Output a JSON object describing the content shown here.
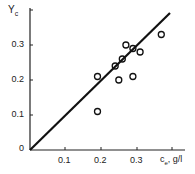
{
  "chart_data": {
    "type": "scatter",
    "title": "",
    "xlabel": "cₑ, g/l",
    "ylabel": "Yᴄ",
    "xlim": [
      0,
      0.45
    ],
    "ylim": [
      0,
      0.4
    ],
    "grid": false,
    "legend": null,
    "x_ticks": [
      0.1,
      0.2,
      0.3,
      0.4
    ],
    "x_tick_labels": [
      "0.1",
      "0.2",
      "0.3",
      ""
    ],
    "y_ticks": [
      0,
      0.1,
      0.2,
      0.3
    ],
    "y_tick_labels": [
      "0",
      "0.1",
      "0.2",
      "0.3"
    ],
    "series": [
      {
        "name": "measured",
        "marker": "open-circle",
        "points": [
          {
            "x": 0.19,
            "y": 0.21
          },
          {
            "x": 0.19,
            "y": 0.11
          },
          {
            "x": 0.24,
            "y": 0.24
          },
          {
            "x": 0.25,
            "y": 0.2
          },
          {
            "x": 0.26,
            "y": 0.26
          },
          {
            "x": 0.27,
            "y": 0.3
          },
          {
            "x": 0.29,
            "y": 0.29
          },
          {
            "x": 0.29,
            "y": 0.21
          },
          {
            "x": 0.31,
            "y": 0.28
          },
          {
            "x": 0.37,
            "y": 0.33
          }
        ]
      },
      {
        "name": "fit",
        "marker": "line",
        "points": [
          {
            "x": 0.0,
            "y": 0.0
          },
          {
            "x": 0.39,
            "y": 0.39
          }
        ]
      }
    ]
  },
  "labels": {
    "y_axis": "Y",
    "y_axis_sub": "c",
    "x_axis": "c",
    "x_axis_sub": "e",
    "x_axis_unit": ", g/l",
    "origin": "0",
    "yt1": "0.1",
    "yt2": "0.2",
    "yt3": "0.3",
    "xt1": "0.1",
    "xt2": "0.2",
    "xt3": "0.3"
  }
}
